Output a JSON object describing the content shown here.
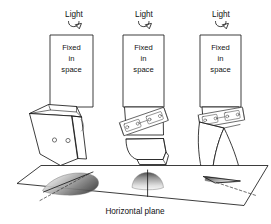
{
  "figure": {
    "caption_bottom": "Horizontal plane",
    "background_color": "#ffffff",
    "line_color": "#1a1a1a",
    "shadow_color": "#8d8d8d"
  },
  "columns": [
    {
      "id": "left",
      "light_label": "Light",
      "light_arrow_icon": "curved-down-arrow-icon",
      "panel_lines": [
        "Fixed",
        "in",
        "space"
      ],
      "object_name": "tilted-wedge-object",
      "shadow_name": "elongated-shadow",
      "shadow_axis_icon": "dashed-axis-line"
    },
    {
      "id": "center",
      "light_label": "Light",
      "light_arrow_icon": "curved-down-arrow-icon",
      "panel_lines": [
        "Fixed",
        "in",
        "space"
      ],
      "object_name": "hinged-block-object",
      "shadow_name": "fan-shadow",
      "shadow_axis_icon": "vertical-axis-line"
    },
    {
      "id": "right",
      "light_label": "Light",
      "light_arrow_icon": "curved-down-arrow-icon",
      "panel_lines": [
        "Fixed",
        "in",
        "space"
      ],
      "object_name": "bent-hinged-object",
      "shadow_name": "narrow-edge-shadow",
      "shadow_axis_icon": "dashed-axis-line"
    }
  ]
}
